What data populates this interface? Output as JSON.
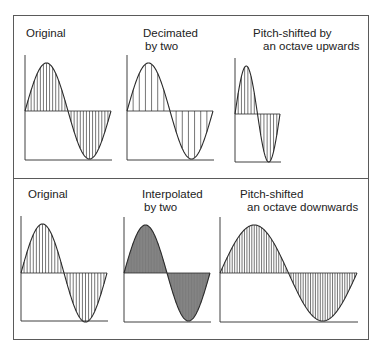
{
  "figure": {
    "top_row": {
      "panels": [
        {
          "id": "original",
          "line1": "Original",
          "line2": "",
          "indent2": 0,
          "label_x": 26,
          "label_y": 27,
          "x0": 25,
          "width": 86,
          "peak": 63,
          "base": 111,
          "bottom": 160,
          "samples": 28,
          "fill": "hatch"
        },
        {
          "id": "decimated",
          "line1": "Decimated",
          "line2": "by two",
          "indent2": 2,
          "label_x": 143,
          "label_y": 27,
          "x0": 127,
          "width": 86,
          "peak": 63,
          "base": 111,
          "bottom": 160,
          "samples": 14,
          "fill": "hatch"
        },
        {
          "id": "pitch-up",
          "line1": "Pitch-shifted by",
          "line2": "an octave upwards",
          "indent2": 10,
          "label_x": 253,
          "label_y": 27,
          "x0": 235,
          "width": 45,
          "peak": 66,
          "base": 114,
          "bottom": 162,
          "samples": 14,
          "fill": "hatch"
        }
      ]
    },
    "bottom_row": {
      "panels": [
        {
          "id": "original-2",
          "line1": "Original",
          "line2": "",
          "indent2": 0,
          "label_x": 28,
          "label_y": 188,
          "x0": 21,
          "width": 86,
          "peak": 224,
          "base": 273,
          "bottom": 321,
          "samples": 28,
          "fill": "hatch"
        },
        {
          "id": "interpolated",
          "line1": "Interpolated",
          "line2": "by two",
          "indent2": 2,
          "label_x": 142,
          "label_y": 188,
          "x0": 124,
          "width": 86,
          "peak": 225,
          "base": 273,
          "bottom": 322,
          "samples": 56,
          "fill": "dense"
        },
        {
          "id": "pitch-down",
          "line1": "Pitch-shifted",
          "line2": "an octave downwards",
          "indent2": 7,
          "label_x": 240,
          "label_y": 188,
          "x0": 220,
          "width": 137,
          "peak": 225,
          "base": 273,
          "bottom": 322,
          "samples": 56,
          "fill": "hatch"
        }
      ]
    },
    "colors": {
      "line": "#2a2a2a",
      "hatch": "#3a3a3a",
      "dense_fill": "#8c8c8c",
      "frame": "#5a5a5a"
    }
  }
}
